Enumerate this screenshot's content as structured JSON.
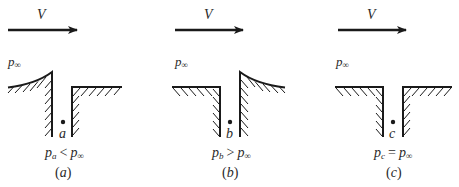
{
  "figure": {
    "type": "pressure-tap-diagram",
    "panels": [
      {
        "id": "a",
        "velocity_label": "V",
        "freestream_pressure_label": "p",
        "freestream_pressure_sub": "∞",
        "point_label": "a",
        "condition": {
          "lhs": "p",
          "lhs_sub": "a",
          "operator": "<",
          "rhs": "p",
          "rhs_sub": "∞"
        },
        "panel_label": "a",
        "surface_shape": "upstream edge raised (curved lip)"
      },
      {
        "id": "b",
        "velocity_label": "V",
        "freestream_pressure_label": "p",
        "freestream_pressure_sub": "∞",
        "point_label": "b",
        "condition": {
          "lhs": "p",
          "lhs_sub": "b",
          "operator": ">",
          "rhs": "p",
          "rhs_sub": "∞"
        },
        "panel_label": "b",
        "surface_shape": "downstream edge raised (curved lip)"
      },
      {
        "id": "c",
        "velocity_label": "V",
        "freestream_pressure_label": "p",
        "freestream_pressure_sub": "∞",
        "point_label": "c",
        "condition": {
          "lhs": "p",
          "lhs_sub": "c",
          "operator": "=",
          "rhs": "p",
          "rhs_sub": "∞"
        },
        "panel_label": "c",
        "surface_shape": "flush"
      }
    ],
    "colors": {
      "ink": "#1a1a1a",
      "text": "#2a2a2a",
      "background": "#ffffff"
    }
  }
}
